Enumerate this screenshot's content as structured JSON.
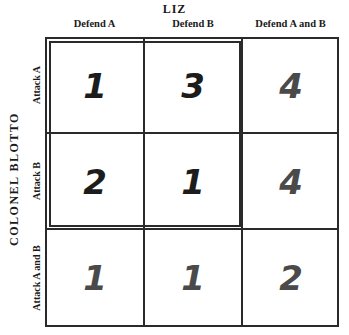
{
  "column_player": "LIZ",
  "row_player": "COLONEL BLOTTO",
  "columns": [
    "Defend A",
    "Defend B",
    "Defend A and B"
  ],
  "rows": [
    "Attack A",
    "Attack B",
    "Attack A and B"
  ],
  "payoffs": [
    [
      "1",
      "3",
      "4"
    ],
    [
      "2",
      "1",
      "4"
    ],
    [
      "1",
      "1",
      "2"
    ]
  ],
  "colors": {
    "highlight_digit": "#1c1c1c",
    "dominated_digit": "#4a4a4a",
    "grid_line": "#2a2a2a"
  }
}
